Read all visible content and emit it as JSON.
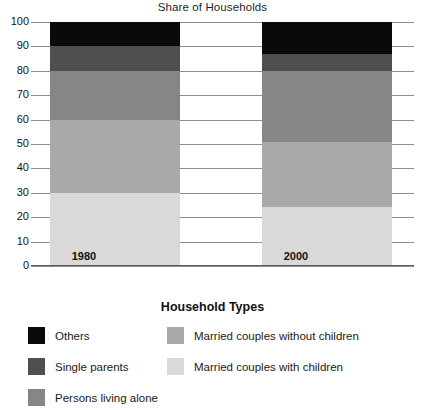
{
  "chart_data": {
    "type": "bar",
    "title": "Share of Households",
    "subtitle": "",
    "xlabel": "",
    "ylabel": "",
    "ylim": [
      0,
      100
    ],
    "grid": true,
    "stacked": true,
    "stack_total": 100,
    "legend_position": "bottom",
    "legend_title": "Household Types",
    "categories": [
      "1980",
      "2000"
    ],
    "tick_labels": [
      "100",
      "90",
      "80",
      "70",
      "60",
      "50",
      "40",
      "30",
      "20",
      "10",
      "0"
    ],
    "tick_values": [
      100,
      90,
      80,
      70,
      60,
      50,
      40,
      30,
      20,
      10,
      0
    ],
    "series": [
      {
        "name": "Married couples with children",
        "values": [
          30,
          24
        ],
        "color": "#d9d9d9"
      },
      {
        "name": "Married couples without children",
        "values": [
          30,
          27
        ],
        "color": "#a9a9a9"
      },
      {
        "name": "Persons living alone",
        "values": [
          20,
          29
        ],
        "color": "#868686"
      },
      {
        "name": "Single parents",
        "values": [
          10,
          7
        ],
        "color": "#4f4f4f"
      },
      {
        "name": "Others",
        "values": [
          10,
          13
        ],
        "color": "#0a0a0a"
      }
    ],
    "cumulative_boundaries": {
      "1980": [
        0,
        30,
        60,
        80,
        90,
        100
      ],
      "2000": [
        0,
        24,
        51,
        80,
        87,
        100
      ]
    }
  },
  "legend": {
    "title": "Household Types",
    "left_column": [
      {
        "label": "Others",
        "color": "#0a0a0a"
      },
      {
        "label": "Single parents",
        "color": "#4f4f4f"
      },
      {
        "label": "Persons living alone",
        "color": "#868686"
      }
    ],
    "right_column": [
      {
        "label": "Married couples without children",
        "color": "#a9a9a9"
      },
      {
        "label": "Married couples with children",
        "color": "#d9d9d9"
      }
    ]
  },
  "axis": {
    "y_ticks": [
      {
        "label": "100",
        "value": 100
      },
      {
        "label": "90",
        "value": 90
      },
      {
        "label": "80",
        "value": 80
      },
      {
        "label": "70",
        "value": 70
      },
      {
        "label": "60",
        "value": 60
      },
      {
        "label": "50",
        "value": 50
      },
      {
        "label": "40",
        "value": 40
      },
      {
        "label": "30",
        "value": 30
      },
      {
        "label": "20",
        "value": 20
      },
      {
        "label": "10",
        "value": 10
      },
      {
        "label": "0",
        "value": 0
      }
    ],
    "x_categories": [
      {
        "label": "1980"
      },
      {
        "label": "2000"
      }
    ]
  },
  "colors": {
    "others": "#0a0a0a",
    "single_parents": "#4f4f4f",
    "persons_living_alone": "#868686",
    "married_without_children": "#a9a9a9",
    "married_with_children": "#d9d9d9",
    "grid": "#8c8c8c",
    "axis": "#5a5a5a",
    "background": "#ffffff"
  }
}
